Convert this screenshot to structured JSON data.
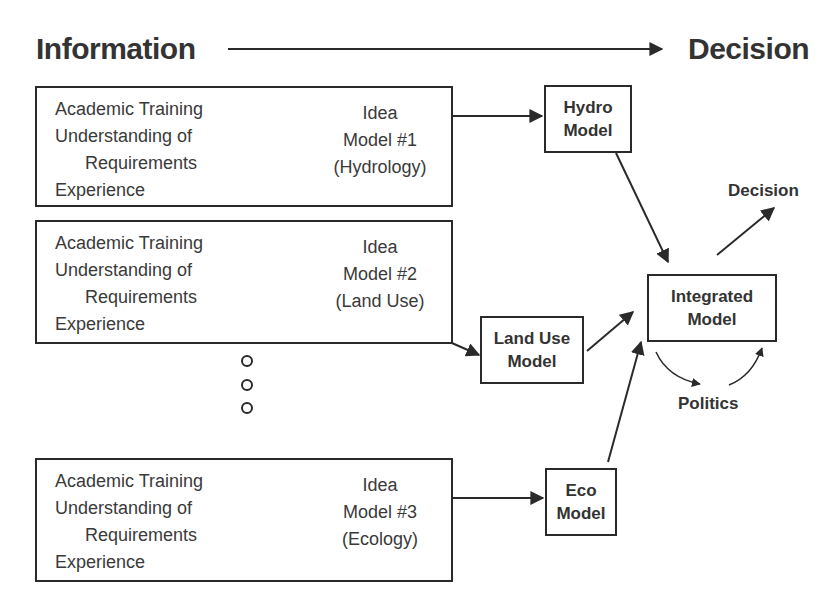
{
  "header": {
    "left_label": "Information",
    "right_label": "Decision"
  },
  "requirement_groups": [
    {
      "lines": [
        "Academic Training",
        "Understanding of",
        "Requirements",
        "Experience"
      ],
      "idea": [
        "Idea",
        "Model #1",
        "(Hydrology)"
      ]
    },
    {
      "lines": [
        "Academic Training",
        "Understanding of",
        "Requirements",
        "Experience"
      ],
      "idea": [
        "Idea",
        "Model #2",
        "(Land Use)"
      ]
    },
    {
      "lines": [
        "Academic Training",
        "Understanding of",
        "Requirements",
        "Experience"
      ],
      "idea": [
        "Idea",
        "Model #3",
        "(Ecology)"
      ]
    }
  ],
  "models": {
    "hydro": [
      "Hydro",
      "Model"
    ],
    "land_use": [
      "Land Use",
      "Model"
    ],
    "eco": [
      "Eco",
      "Model"
    ],
    "integrated": [
      "Integrated",
      "Model"
    ]
  },
  "labels": {
    "decision": "Decision",
    "politics": "Politics"
  },
  "ellipsis_dots": 3
}
